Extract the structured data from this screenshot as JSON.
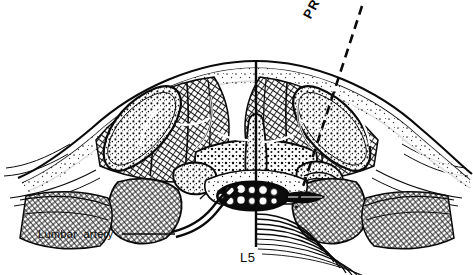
{
  "figure": {
    "background_color": "#ffffff",
    "ink_color": "#0a0a0a",
    "width": 473,
    "height": 275
  },
  "labels": {
    "lumbar_artery": "Lumbar artery",
    "vertebral_level": "L5",
    "probe": "PROBE"
  },
  "leader_lines": {
    "lumbar_artery": {
      "x1": 122,
      "y1": 234,
      "x2": 175,
      "y2": 234
    }
  },
  "probe": {
    "style": "dashed",
    "x1": 362,
    "y1": 6,
    "x2": 296,
    "y2": 208,
    "dash": "9 6",
    "width": 2.6,
    "label_rotation_deg": -62
  },
  "midline": {
    "label": "interspinous-ligament-midline",
    "x": 256,
    "y1": 61,
    "y2": 247,
    "width": 2.4
  },
  "anatomy": {
    "skin_arc": {
      "left_x": 46,
      "right_x": 428,
      "apex_y": 61,
      "edge_y": 150
    },
    "dural_sac": {
      "cx": 253,
      "cy": 196,
      "rx": 35,
      "ry": 14,
      "rootlets": 11
    },
    "vertebral_body_arcs": {
      "cx": 262,
      "cy": 205,
      "count": 9
    },
    "regions": [
      {
        "name": "subcutaneous-fat-layer",
        "side": "both"
      },
      {
        "name": "thoracolumbar-fascia",
        "side": "both"
      },
      {
        "name": "erector-spinae-muscle-left",
        "side": "left"
      },
      {
        "name": "erector-spinae-muscle-right",
        "side": "right"
      },
      {
        "name": "multifidus-muscle",
        "side": "center"
      },
      {
        "name": "spinous-process",
        "side": "center"
      },
      {
        "name": "lamina-left",
        "side": "left"
      },
      {
        "name": "lamina-right",
        "side": "right"
      },
      {
        "name": "transverse-process-left",
        "side": "left"
      },
      {
        "name": "transverse-process-right",
        "side": "right"
      },
      {
        "name": "facet-joint-left",
        "side": "left"
      },
      {
        "name": "facet-joint-right",
        "side": "right"
      },
      {
        "name": "psoas-major-left",
        "side": "left"
      },
      {
        "name": "psoas-major-right",
        "side": "right"
      },
      {
        "name": "quadratus-lumborum-left",
        "side": "left"
      },
      {
        "name": "quadratus-lumborum-right",
        "side": "right"
      },
      {
        "name": "epidural-fat",
        "side": "center"
      },
      {
        "name": "lumbar-artery",
        "side": "left"
      }
    ]
  }
}
